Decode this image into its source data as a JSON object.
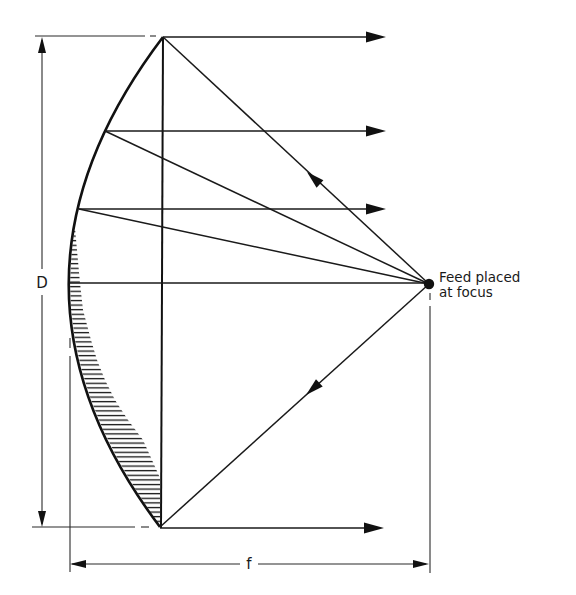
{
  "diagram": {
    "type": "parabolic reflector antenna geometry",
    "labels": {
      "aperture_diameter": "D",
      "focal_length": "f",
      "feed_line1": "Feed placed",
      "feed_line2": "at focus"
    },
    "components": {
      "reflector": "parabolic dish profile (thick curve)",
      "aperture_plane": "vertical chord line across dish rim",
      "feed": "filled dot at focus",
      "rays_from_feed": 4,
      "collimated_rays": 5,
      "hatched_region": "path-length region between parabola and aperture plane"
    },
    "colors": {
      "ink": "#111111",
      "background": "#ffffff"
    }
  }
}
